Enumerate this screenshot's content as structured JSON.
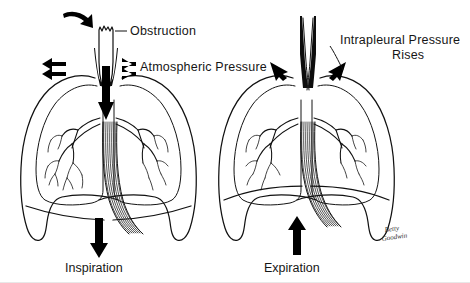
{
  "figure": {
    "background_color": "#ffffff",
    "ink_color": "#111111",
    "signature": {
      "line1": "Betty",
      "line2": "Goodwin"
    }
  },
  "panels": [
    {
      "id": "inspiration",
      "side": "left",
      "caption": "Inspiration",
      "airflow_direction": "down",
      "trachea_state": "open",
      "diaphragm_state": "descended-flattened",
      "labels": [
        {
          "name": "obstruction",
          "text": "Obstruction",
          "has_leader_line": true,
          "marker": "curved-arrow-down"
        },
        {
          "name": "atmospheric-pressure",
          "text": "Atmospheric  Pressure",
          "has_leader_line": false,
          "marker": "double-arrow-left"
        }
      ]
    },
    {
      "id": "expiration",
      "side": "right",
      "caption": "Expiration",
      "airflow_direction": "up",
      "trachea_state": "collapsed-narrowed",
      "diaphragm_state": "elevated-domed",
      "labels": [
        {
          "name": "intrapleural-pressure-rises",
          "text_line1": "Intrapleural Pressure",
          "text_line2": "Rises",
          "has_leader_line": true,
          "marker": "converging-arrows-inward"
        }
      ]
    }
  ]
}
